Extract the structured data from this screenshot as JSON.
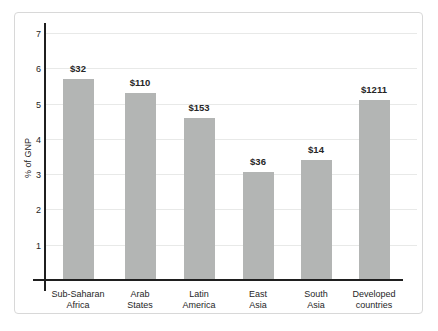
{
  "chart_data": {
    "type": "bar",
    "title": "",
    "xlabel": "",
    "ylabel": "% of GNP",
    "ylim": [
      0,
      7
    ],
    "yticks": [
      1,
      2,
      3,
      4,
      5,
      6,
      7
    ],
    "grid": true,
    "legend": false,
    "categories": [
      [
        "Sub-Saharan",
        "Africa"
      ],
      [
        "Arab",
        "States"
      ],
      [
        "Latin",
        "America"
      ],
      [
        "East",
        "Asia"
      ],
      [
        "South",
        "Asia"
      ],
      [
        "Developed",
        "countries"
      ]
    ],
    "values": [
      5.7,
      5.3,
      4.6,
      3.05,
      3.4,
      5.1
    ],
    "bar_labels": [
      "$32",
      "$110",
      "$153",
      "$36",
      "$14",
      "$1211"
    ],
    "colors": {
      "bar_fill": "#b3b5b4",
      "gridline": "#e8e9e8",
      "axis": "#1f1f1f",
      "text": "#262626",
      "panel_border": "#d8d8d8",
      "background": "#ffffff"
    }
  }
}
